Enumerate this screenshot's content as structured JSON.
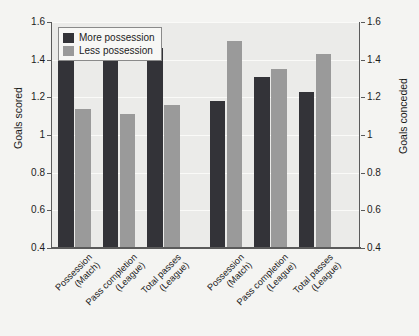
{
  "chart_data": {
    "type": "bar",
    "title": "",
    "xlabel": "",
    "ylabel": "Goals scored",
    "y2label": "Goals conceded",
    "ylim": [
      0.4,
      1.6
    ],
    "y2lim": [
      0.4,
      1.6
    ],
    "yticks": [
      "1.6",
      "1.4",
      "1.2",
      "1",
      "0.8",
      "0.6",
      "0.4"
    ],
    "ytick_values": [
      1.6,
      1.4,
      1.2,
      1.0,
      0.8,
      0.6,
      0.4
    ],
    "y2ticks": [
      "1.6",
      "1.4",
      "1.2",
      "1",
      "0.8",
      "0.6",
      "0.4"
    ],
    "grid": true,
    "legend_position": "top-left",
    "categories": [
      {
        "line1": "Possession",
        "line2": "(Match)"
      },
      {
        "line1": "Pass completion",
        "line2": "(League)"
      },
      {
        "line1": "Total passes",
        "line2": "(League)"
      },
      {
        "line1": "Possession",
        "line2": "(Match)"
      },
      {
        "line1": "Pass completion",
        "line2": "(League)"
      },
      {
        "line1": "Total passes",
        "line2": "(League)"
      }
    ],
    "groups": [
      {
        "name": "Goals scored",
        "categories": [
          0,
          1,
          2
        ]
      },
      {
        "name": "Goals conceded",
        "categories": [
          3,
          4,
          5
        ]
      }
    ],
    "series": [
      {
        "name": "More possession",
        "color": "#333338",
        "values": [
          1.44,
          1.45,
          1.46,
          1.18,
          1.31,
          1.23
        ]
      },
      {
        "name": "Less possession",
        "color": "#9a9a9a",
        "values": [
          1.14,
          1.11,
          1.16,
          1.5,
          1.35,
          1.43
        ]
      }
    ]
  },
  "legend": {
    "items": [
      {
        "label": "More possession",
        "key": "more"
      },
      {
        "label": "Less possession",
        "key": "less"
      }
    ]
  },
  "colors": {
    "more_possession": "#333338",
    "less_possession": "#9a9a9a",
    "plot_background": "#ebebe9",
    "figure_background": "#f4f4f2",
    "axis": "#5a5a5a"
  }
}
